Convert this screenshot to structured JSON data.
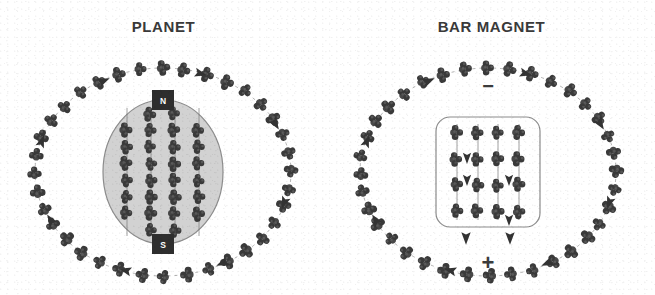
{
  "figure": {
    "background_color": "#ffffff",
    "ink_color": "#3c3c3c",
    "style": "scanned grayscale textbook illustration"
  },
  "panels": [
    {
      "id": "planet",
      "title": "PLANET",
      "body_shape": "ellipse",
      "body_fill": "#d2d2d2",
      "body_stroke": "#8c8c8c",
      "pole_top": {
        "label": "N",
        "shape": "square",
        "fill": "#2e2e2e",
        "text_color": "#ffffff"
      },
      "pole_bottom": {
        "label": "S",
        "shape": "square",
        "fill": "#2e2e2e",
        "text_color": "#ffffff"
      },
      "interior_columns": 4,
      "interior_rows": 8,
      "field_ring": {
        "clusters": 36,
        "line_style": "dashed",
        "arrowheads": 8
      }
    },
    {
      "id": "bar-magnet",
      "title": "BAR MAGNET",
      "body_shape": "rounded-rectangle",
      "body_fill": "#ffffff",
      "body_stroke": "#8c8c8c",
      "pole_top": {
        "label": "−",
        "shape": "glyph",
        "fill": "#3c3c3c"
      },
      "pole_bottom": {
        "label": "+",
        "shape": "glyph",
        "fill": "#3c3c3c"
      },
      "interior_columns": 4,
      "interior_rows": 4,
      "field_ring": {
        "clusters": 36,
        "line_style": "dashed",
        "arrowheads": 8
      }
    }
  ],
  "cluster": {
    "name": "molecule-cluster",
    "atom_count": 4,
    "atom_fill": "#3a3a3a",
    "atom_highlight": "#6e6e6e",
    "description": "tetrahedral cluster of four dark spheres"
  }
}
